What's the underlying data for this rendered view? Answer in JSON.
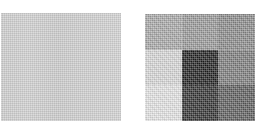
{
  "figure": {
    "background_color": "#ffffff",
    "panel_count": 2
  },
  "panels": [
    {
      "name": "uniform-heatmap",
      "position": {
        "x": 1,
        "y": 13,
        "width": 120,
        "height": 108
      },
      "description": "uniform light gray block"
    },
    {
      "name": "grid-heatmap",
      "position": {
        "x": 145,
        "y": 14,
        "width": 110,
        "height": 107
      },
      "description": "3 by 3 grayscale grid"
    }
  ],
  "chart_data": [
    {
      "type": "heatmap",
      "name": "uniform-heatmap",
      "title": "",
      "xlabel": "",
      "ylabel": "",
      "rows": 1,
      "cols": 1,
      "categories_x": [],
      "categories_y": [],
      "values": [
        [
          0.18
        ]
      ],
      "colors": [
        [
          "#d2d2d2"
        ]
      ],
      "colormap": "gray",
      "vmin": 0,
      "vmax": 1,
      "grid": false,
      "legend": "none",
      "notes": "single flat light-gray field with dithering texture and faint vertical banding"
    },
    {
      "type": "heatmap",
      "name": "grid-heatmap",
      "title": "",
      "xlabel": "",
      "ylabel": "",
      "rows": 3,
      "cols": 3,
      "categories_x": [],
      "categories_y": [],
      "values": [
        [
          0.34,
          0.41,
          0.47
        ],
        [
          0.15,
          0.88,
          0.52
        ],
        [
          0.11,
          0.82,
          0.65
        ]
      ],
      "colors": [
        [
          "#a9a9a9",
          "#999999",
          "#8a8a8a"
        ],
        [
          "#d9d9d9",
          "#1e1e1e",
          "#7b7b7b"
        ],
        [
          "#e5e5e5",
          "#2f2f2f",
          "#5b5b5b"
        ]
      ],
      "colormap": "gray_r",
      "vmin": 0,
      "vmax": 1,
      "grid": false,
      "legend": "none",
      "notes": "3x3 block heatmap; darkest cell is center, lightest cell is bottom-left"
    }
  ]
}
